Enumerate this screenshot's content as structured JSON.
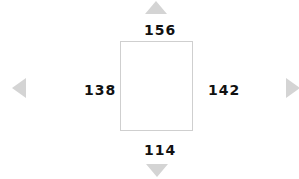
{
  "padding_control": {
    "top": {
      "value": "156",
      "icon": "arrow-up-icon"
    },
    "bottom": {
      "value": "114",
      "icon": "arrow-down-icon"
    },
    "left": {
      "value": "138",
      "icon": "arrow-left-icon"
    },
    "right": {
      "value": "142",
      "icon": "arrow-right-icon"
    }
  },
  "colors": {
    "arrow": "#d4d4d4",
    "text": "#111111",
    "box_border": "#cfcfcf"
  }
}
